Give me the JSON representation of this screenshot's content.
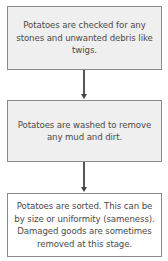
{
  "diagram": {
    "type": "flowchart",
    "direction": "top-to-bottom",
    "steps": [
      {
        "id": "step-1",
        "text": "Potatoes are checked for any stones and unwanted debris like twigs.",
        "fill": "#efefef"
      },
      {
        "id": "step-2",
        "text": "Potatoes are washed to remove any mud and dirt.",
        "fill": "#efefef"
      },
      {
        "id": "step-3",
        "text": "Potatoes are sorted. This can be by size or uniformity (sameness). Damaged goods are sometimes removed at this stage.",
        "fill": "#ffffff"
      }
    ],
    "edges": [
      {
        "from": "step-1",
        "to": "step-2"
      },
      {
        "from": "step-2",
        "to": "step-3"
      }
    ],
    "colors": {
      "border": "#8a8a8a",
      "text": "#4a4a4a",
      "arrow": "#555555"
    }
  }
}
